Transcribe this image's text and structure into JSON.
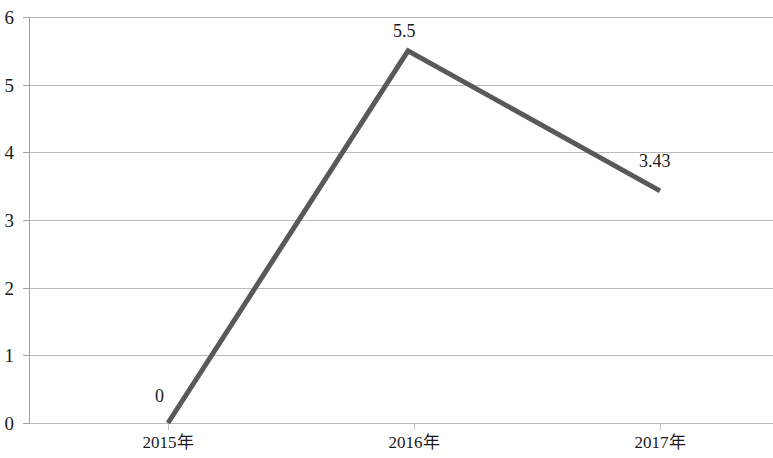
{
  "chart_data": {
    "type": "line",
    "title": "",
    "subtitle": "",
    "xlabel": "",
    "ylabel": "",
    "categories": [
      "2015年",
      "2016年",
      "2017年"
    ],
    "series": [
      {
        "name": "",
        "values": [
          0,
          5.5,
          3.43
        ],
        "color": "#595959",
        "line_width": 5,
        "point_labels": [
          "0",
          "5.5",
          "3.43"
        ]
      }
    ],
    "ylim": [
      0,
      6
    ],
    "y_ticks": [
      0,
      1,
      2,
      3,
      4,
      5,
      6
    ],
    "y_tick_labels": [
      "0",
      "1",
      "2",
      "3",
      "4",
      "5",
      "6"
    ],
    "grid": true,
    "grid_color": "#b8bcc0",
    "axis_color": "#9aa0a6",
    "legend": false,
    "legend_position": "none"
  },
  "axis": {
    "y_labels": [
      "6",
      "5",
      "4",
      "3",
      "2",
      "1",
      "0"
    ],
    "x_labels": [
      "2015年",
      "2016年",
      "2017年"
    ]
  },
  "labels": {
    "point_0": "0",
    "point_1": "5.5",
    "point_2": "3.43"
  }
}
